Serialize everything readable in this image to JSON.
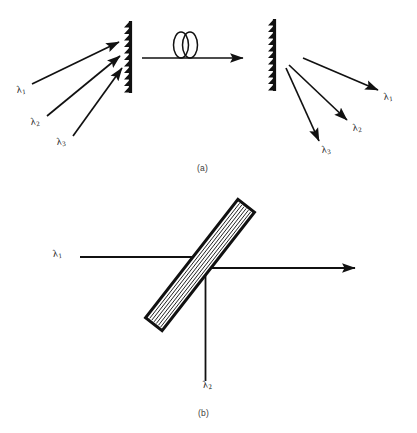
{
  "figure": {
    "background_color": "#ffffff",
    "ink_color": "#111111",
    "width": 417,
    "height": 433
  },
  "panel_a": {
    "caption": "(a)",
    "description": "Grating-based wavelength demultiplexer with interconnecting fiber",
    "input_labels": [
      {
        "name": "lambda-1",
        "lambda": "λ",
        "subscript": "1",
        "x": 16,
        "y": 88
      },
      {
        "name": "lambda-2",
        "lambda": "λ",
        "subscript": "2",
        "x": 30,
        "y": 120
      },
      {
        "name": "lambda-3",
        "lambda": "λ",
        "subscript": "3",
        "x": 56,
        "y": 140
      }
    ],
    "output_labels": [
      {
        "name": "lambda-1",
        "lambda": "λ",
        "subscript": "1",
        "x": 383,
        "y": 95
      },
      {
        "name": "lambda-2",
        "lambda": "λ",
        "subscript": "2",
        "x": 352,
        "y": 126
      },
      {
        "name": "lambda-3",
        "lambda": "λ",
        "subscript": "3",
        "x": 321,
        "y": 148
      }
    ],
    "left_grating": {
      "name": "left-grating",
      "x": 127,
      "y_top": 22,
      "y_bottom": 92,
      "teeth": 11,
      "tooth_direction": "left"
    },
    "right_grating": {
      "name": "right-grating",
      "x": 272,
      "y_top": 20,
      "y_bottom": 90,
      "teeth": 11,
      "tooth_direction": "left"
    },
    "fiber": {
      "name": "fiber-link",
      "loop_count": 2,
      "line_y": 58,
      "x_start": 142,
      "x_end": 244
    },
    "input_rays": [
      {
        "name": "input-ray-1",
        "x1": 32,
        "y1": 84,
        "x2": 120,
        "y2": 42
      },
      {
        "name": "input-ray-2",
        "x1": 47,
        "y1": 116,
        "x2": 121,
        "y2": 57
      },
      {
        "name": "input-ray-3",
        "x1": 73,
        "y1": 136,
        "x2": 123,
        "y2": 69
      }
    ],
    "output_rays": [
      {
        "name": "output-ray-1",
        "x1": 303,
        "y1": 58,
        "x2": 379,
        "y2": 91
      },
      {
        "name": "output-ray-2",
        "x1": 289,
        "y1": 66,
        "x2": 348,
        "y2": 121
      },
      {
        "name": "output-ray-3",
        "x1": 287,
        "y1": 68,
        "x2": 320,
        "y2": 143
      }
    ]
  },
  "panel_b": {
    "caption": "(b)",
    "description": "Tilted multilayer dichroic filter combining two wavelengths",
    "filter": {
      "name": "dichroic-filter",
      "center_x": 200,
      "center_y": 265,
      "length": 150,
      "thickness": 21,
      "angle_deg": -52,
      "internal_lines": 6
    },
    "beams": [
      {
        "name": "beam-lambda-1",
        "orientation": "horizontal-in",
        "x1": 80,
        "y1": 257,
        "x2": 204,
        "y2": 257
      },
      {
        "name": "beam-lambda-2",
        "orientation": "vertical-in",
        "x1": 205,
        "y1": 270,
        "x2": 205,
        "y2": 383
      },
      {
        "name": "beam-output",
        "orientation": "horizontal-out",
        "x1": 205,
        "y1": 268,
        "x2": 356,
        "y2": 268
      }
    ],
    "labels": [
      {
        "name": "lambda-1",
        "lambda": "λ",
        "subscript": "1",
        "x": 52,
        "y": 251
      },
      {
        "name": "lambda-2",
        "lambda": "λ",
        "subscript": "2",
        "x": 203,
        "y": 383
      }
    ]
  }
}
